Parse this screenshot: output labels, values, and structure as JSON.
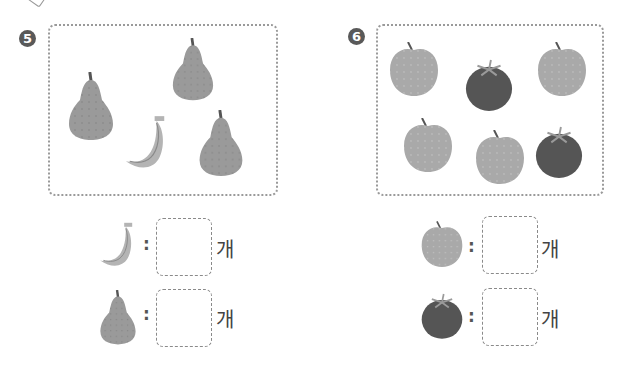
{
  "problems": [
    {
      "number": "5",
      "items_in_frame": [
        "pear",
        "pear",
        "banana",
        "pear"
      ],
      "questions": [
        {
          "fruit": "banana",
          "answer": "",
          "unit": "개"
        },
        {
          "fruit": "pear",
          "answer": "",
          "unit": "개"
        }
      ]
    },
    {
      "number": "6",
      "items_in_frame": [
        "apple",
        "tomato",
        "apple",
        "apple",
        "apple",
        "tomato"
      ],
      "questions": [
        {
          "fruit": "apple",
          "answer": "",
          "unit": "개"
        },
        {
          "fruit": "tomato",
          "answer": "",
          "unit": "개"
        }
      ]
    }
  ],
  "colon": ":",
  "colors": {
    "pear": "#9a9a9a",
    "banana": "#b4b4b4",
    "apple": "#a9a9a9",
    "tomato": "#555555",
    "frame_border": "#9a9a9a",
    "badge": "#595959"
  }
}
